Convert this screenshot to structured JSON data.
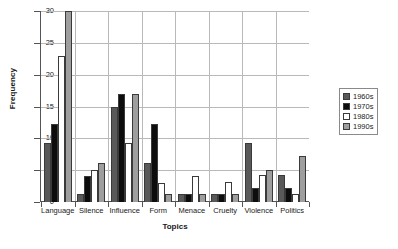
{
  "chart_data": {
    "type": "bar",
    "title": "",
    "subtitle": "",
    "xlabel": "Topics",
    "ylabel": "Frequency",
    "ylim": [
      0,
      30
    ],
    "yticks": [
      0,
      5,
      10,
      15,
      20,
      25,
      30
    ],
    "grid": "horizontal-and-vertical",
    "legend_position": "right",
    "categories": [
      "Language",
      "Silence",
      "Influence",
      "Form",
      "Menace",
      "Cruelty",
      "Violence",
      "Politics"
    ],
    "series": [
      {
        "name": "1960s",
        "color": "#595959",
        "values": [
          9.2,
          1.2,
          15.0,
          6.2,
          1.2,
          1.2,
          9.2,
          4.3
        ]
      },
      {
        "name": "1970s",
        "color": "#0d0d0d",
        "values": [
          12.3,
          4.1,
          17.0,
          12.3,
          1.2,
          1.2,
          2.2,
          2.2
        ]
      },
      {
        "name": "1980s",
        "color": "#ffffff",
        "values": [
          23.0,
          5.0,
          9.2,
          3.0,
          4.1,
          3.2,
          4.2,
          1.2
        ]
      },
      {
        "name": "1990s",
        "color": "#9e9e9e",
        "values": [
          30.0,
          6.2,
          17.0,
          1.2,
          1.2,
          1.2,
          5.0,
          7.2
        ]
      }
    ]
  },
  "legend": {
    "entries": [
      {
        "label": "1960s"
      },
      {
        "label": "1970s"
      },
      {
        "label": "1980s"
      },
      {
        "label": "1990s"
      }
    ]
  },
  "axes": {
    "y_tick_labels": [
      "0",
      "5",
      "10",
      "15",
      "20",
      "25",
      "30"
    ],
    "y_title": "Frequency",
    "x_title": "Topics"
  },
  "colors": {
    "series_1960s": "#595959",
    "series_1970s": "#0d0d0d",
    "series_1980s": "#ffffff",
    "series_1990s": "#9e9e9e",
    "axis": "#555555",
    "gridline": "#b9b9b9",
    "background": "#ffffff"
  }
}
